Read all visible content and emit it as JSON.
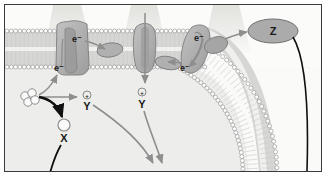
{
  "figure": {
    "border_color": "#3a3a3a",
    "background_color": "#f4f4f2"
  },
  "palette": {
    "protein_fill": "#a8a8a8",
    "protein_fill_light": "#bcbcbc",
    "protein_stroke": "#6e6e6e",
    "membrane_head": "#ffffff",
    "membrane_head_stroke": "#9a9a9a",
    "membrane_tail": "#c9c9c9",
    "gray_arrow": "#8e8e8e",
    "black_arrow": "#101010",
    "light_beam": "#e3e3e0",
    "label_color": "#1a1a1a",
    "lumen_fill": "#fbfbfa",
    "stroma_fill": "#eeeeec"
  },
  "membrane": {
    "name": "lipid-bilayer",
    "head_count_top": 46,
    "head_count_bottom": 46,
    "description": "phospholipid bilayer, circular head groups with hydrocarbon tails"
  },
  "light_beams": [
    {
      "id": "beam-1",
      "x": 62,
      "label": "light"
    },
    {
      "id": "beam-2",
      "x": 138,
      "label": "light"
    },
    {
      "id": "beam-3",
      "x": 220,
      "label": "light"
    }
  ],
  "complexes": [
    {
      "id": "complex-left",
      "name": "photosystem-ii-complex",
      "label_top": "e⁻",
      "label_bottom": "e⁻"
    },
    {
      "id": "carrier-left",
      "name": "mobile-electron-carrier-left",
      "label": ""
    },
    {
      "id": "complex-center",
      "name": "proton-pump-channel-complex",
      "label": ""
    },
    {
      "id": "carrier-right",
      "name": "mobile-electron-carrier-right",
      "label": ""
    },
    {
      "id": "complex-right",
      "name": "photosystem-i-complex",
      "label_top": "e⁻",
      "label_bottom": "e⁻"
    },
    {
      "id": "carrier-far-right",
      "name": "terminal-electron-carrier",
      "label": ""
    }
  ],
  "labels": {
    "electron_1": "e⁻",
    "electron_2": "e⁻",
    "electron_3": "e⁻",
    "electron_4": "e⁻",
    "proton_1": "⊕",
    "proton_2": "⊕",
    "carrier_y_1": "Y",
    "carrier_y_2": "Y",
    "product_x": "X",
    "product_z": "Z"
  },
  "species": {
    "substrate_cluster": {
      "name": "substrate-molecule-cluster",
      "circle_count": 4,
      "label": ""
    },
    "x_molecule": {
      "name": "x-molecule",
      "label": "X"
    },
    "z_molecule": {
      "name": "z-molecule",
      "label": "Z"
    }
  },
  "arrows": [
    {
      "id": "arrow-substrate-to-complex",
      "color": "#8e8e8e",
      "kind": "electron-transfer",
      "from": "substrate-cluster",
      "to": "complex-left"
    },
    {
      "id": "arrow-substrate-to-x",
      "color": "#101010",
      "kind": "product-formation",
      "from": "substrate-cluster",
      "to": "x-molecule"
    },
    {
      "id": "arrow-to-y1",
      "color": "#8e8e8e",
      "kind": "proton-transfer",
      "from": "substrate-cluster",
      "to": "carrier-y-1"
    },
    {
      "id": "arrow-y1-down",
      "color": "#8e8e8e",
      "kind": "carrier-diffusion",
      "from": "carrier-y-1",
      "to": "stroma"
    },
    {
      "id": "arrow-y2-down",
      "color": "#8e8e8e",
      "kind": "carrier-diffusion",
      "from": "carrier-y-2",
      "to": "stroma"
    },
    {
      "id": "arrow-channel-proton",
      "color": "#8e8e8e",
      "kind": "proton-flux",
      "from": "lumen",
      "to": "carrier-y-2"
    },
    {
      "id": "arrow-complex-left-to-carrier",
      "color": "#8e8e8e",
      "kind": "electron-transfer"
    },
    {
      "id": "arrow-carrier-to-complex-right",
      "color": "#8e8e8e",
      "kind": "electron-transfer"
    },
    {
      "id": "arrow-complex-right-to-z",
      "color": "#8e8e8e",
      "kind": "electron-transfer",
      "to": "z-molecule"
    },
    {
      "id": "arrow-x-tail",
      "color": "#101010",
      "kind": "pathway-continuation"
    },
    {
      "id": "arrow-z-tail",
      "color": "#101010",
      "kind": "pathway-continuation"
    }
  ]
}
